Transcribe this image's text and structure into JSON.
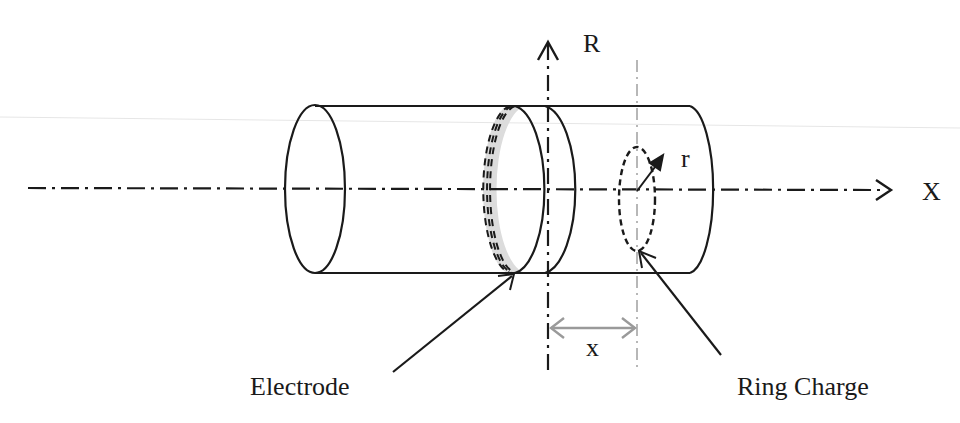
{
  "figure": {
    "type": "schematic",
    "labels": {
      "r_axis": "R",
      "x_axis": "X",
      "radius": "r",
      "distance": "x",
      "electrode": "Electrode",
      "ring_charge": "Ring Charge"
    },
    "colors": {
      "line": "#1a1a1a",
      "electrode_fill": "#dcdcdc",
      "dimension": "#9a9a9a",
      "guide": "#a0a0a0"
    }
  }
}
